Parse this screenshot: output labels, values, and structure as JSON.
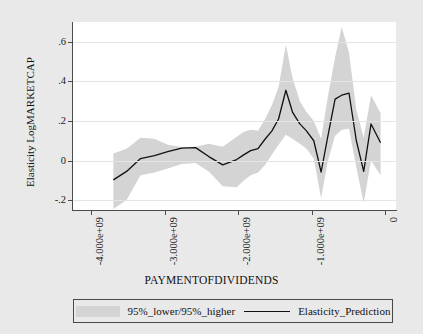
{
  "chart_data": {
    "type": "line",
    "title": "",
    "xlabel": "PAYMENTOFDIVIDENDS",
    "ylabel": "Elasticity LogMARKETCAP",
    "xlim": [
      -4250000000,
      150000000
    ],
    "ylim": [
      -0.25,
      0.7
    ],
    "grid": true,
    "legend_position": "bottom",
    "y_ticks": [
      {
        "value": 0.6,
        "label": ".6"
      },
      {
        "value": 0.4,
        "label": ".4"
      },
      {
        "value": 0.2,
        "label": ".2"
      },
      {
        "value": 0.0,
        "label": "0"
      },
      {
        "value": -0.2,
        "label": "-.2"
      }
    ],
    "x_ticks": [
      {
        "value": -4000000000,
        "label": "-4.000e+09"
      },
      {
        "value": -3000000000,
        "label": "-3.000e+09"
      },
      {
        "value": -2000000000,
        "label": "-2.000e+09"
      },
      {
        "value": -1000000000,
        "label": "-1.000e+09"
      },
      {
        "value": 0,
        "label": "0"
      }
    ],
    "legend": [
      {
        "name": "95%_lower/95%_higher",
        "marker": "band",
        "color": "#d4d4d4"
      },
      {
        "name": "Elasticity_Prediction",
        "marker": "line",
        "color": "#111111"
      }
    ],
    "x": [
      -3700000000,
      -3520000000,
      -3330000000,
      -3140000000,
      -2960000000,
      -2770000000,
      -2580000000,
      -2400000000,
      -2210000000,
      -2020000000,
      -1920000000,
      -1830000000,
      -1730000000,
      -1640000000,
      -1540000000,
      -1450000000,
      -1350000000,
      -1260000000,
      -1160000000,
      -1070000000,
      -970000000,
      -870000000,
      -780000000,
      -680000000,
      -590000000,
      -490000000,
      -390000000,
      -290000000,
      -190000000,
      -60000000
    ],
    "series": [
      {
        "name": "Elasticity_Prediction",
        "color": "#111111",
        "values": [
          -0.098,
          -0.055,
          0.01,
          0.025,
          0.045,
          0.063,
          0.065,
          0.02,
          -0.022,
          0.005,
          0.03,
          0.05,
          0.06,
          0.105,
          0.15,
          0.21,
          0.355,
          0.245,
          0.185,
          0.15,
          0.1,
          -0.058,
          0.12,
          0.31,
          0.33,
          0.34,
          0.1,
          -0.055,
          0.185,
          0.09
        ]
      },
      {
        "name": "95%_lower",
        "color": "#d4d4d4",
        "values": [
          -0.245,
          -0.2,
          -0.075,
          -0.06,
          -0.04,
          -0.018,
          -0.012,
          -0.055,
          -0.13,
          -0.135,
          -0.1,
          -0.075,
          -0.06,
          -0.025,
          0.03,
          0.08,
          0.13,
          0.11,
          0.085,
          0.06,
          0.01,
          -0.19,
          -0.005,
          0.125,
          0.155,
          0.16,
          -0.035,
          -0.215,
          0.0,
          -0.075
        ]
      },
      {
        "name": "95%_higher",
        "color": "#d4d4d4",
        "values": [
          0.035,
          0.06,
          0.115,
          0.11,
          0.08,
          0.068,
          0.07,
          0.085,
          0.07,
          0.12,
          0.145,
          0.155,
          0.15,
          0.205,
          0.28,
          0.37,
          0.585,
          0.42,
          0.3,
          0.245,
          0.2,
          0.11,
          0.32,
          0.52,
          0.675,
          0.545,
          0.255,
          0.115,
          0.33,
          0.24
        ]
      }
    ]
  }
}
